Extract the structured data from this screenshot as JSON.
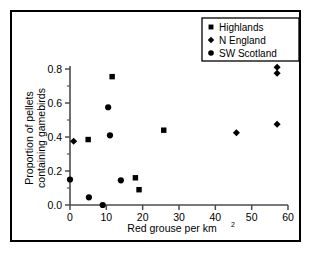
{
  "chart_data": {
    "type": "scatter",
    "title": "",
    "xlabel": "Red grouse per km²",
    "xlabel_base": "Red grouse per km",
    "xlabel_sup": "2",
    "ylabel": "Proportion of pellets containing gamebirds",
    "ylabel_line1": "Proportion of pellets",
    "ylabel_line2": "containing gamebirds",
    "xlim": [
      0,
      60
    ],
    "ylim": [
      0.0,
      0.8
    ],
    "xticks": [
      0,
      10,
      20,
      30,
      40,
      50,
      60
    ],
    "xtick_labels": [
      "0",
      "10",
      "20",
      "30",
      "40",
      "50",
      "60"
    ],
    "yticks": [
      0.0,
      0.2,
      0.4,
      0.6,
      0.8
    ],
    "ytick_labels": [
      "0.0",
      "0.2",
      "0.4",
      "0.6",
      "0.8"
    ],
    "y_minor_ticks": [
      0.1,
      0.3,
      0.5,
      0.7
    ],
    "grid": false,
    "legend_position": "top-right",
    "series": [
      {
        "name": "Highlands",
        "marker": "square",
        "color": "#000000",
        "points": [
          {
            "x": 5.0,
            "y": 0.385
          },
          {
            "x": 11.6,
            "y": 0.755
          },
          {
            "x": 18.0,
            "y": 0.16
          },
          {
            "x": 19.0,
            "y": 0.09
          },
          {
            "x": 25.8,
            "y": 0.44
          }
        ]
      },
      {
        "name": "N England",
        "marker": "diamond",
        "color": "#000000",
        "points": [
          {
            "x": 1.0,
            "y": 0.375
          },
          {
            "x": 45.8,
            "y": 0.425
          },
          {
            "x": 57.0,
            "y": 0.81
          },
          {
            "x": 57.0,
            "y": 0.775
          },
          {
            "x": 57.0,
            "y": 0.475
          }
        ]
      },
      {
        "name": "SW Scotland",
        "marker": "circle",
        "color": "#000000",
        "points": [
          {
            "x": 0.0,
            "y": 0.15
          },
          {
            "x": 5.2,
            "y": 0.045
          },
          {
            "x": 9.0,
            "y": 0.0
          },
          {
            "x": 10.5,
            "y": 0.575
          },
          {
            "x": 11.0,
            "y": 0.41
          },
          {
            "x": 14.0,
            "y": 0.145
          }
        ]
      }
    ]
  },
  "legend": {
    "entries": [
      {
        "label": "Highlands",
        "marker": "square"
      },
      {
        "label": "N England",
        "marker": "diamond"
      },
      {
        "label": "SW Scotland",
        "marker": "circle"
      }
    ]
  }
}
